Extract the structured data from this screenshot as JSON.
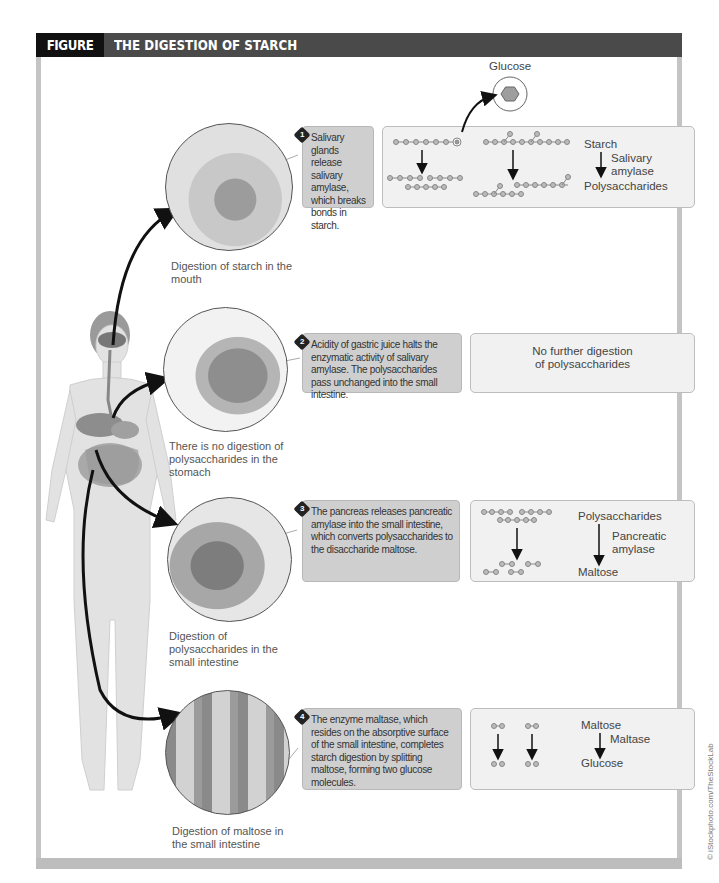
{
  "figure": {
    "number": "FIGURE 4.11",
    "title": "THE DIGESTION OF STARCH",
    "credit": "© iStockphoto.com/TheStockLab"
  },
  "glucose_label": "Glucose",
  "steps": [
    {
      "number": "1",
      "caption": "Salivary glands release salivary amylase, which breaks bonds in starch.",
      "location_label": "Digestion of starch in the mouth",
      "illustration": "mouth-cross-section",
      "result": {
        "top": "Starch",
        "enzyme": "Salivary amylase",
        "bottom": "Polysaccharides"
      }
    },
    {
      "number": "2",
      "caption": "Acidity of gastric juice halts the enzymatic activity of salivary amylase. The polysaccharides pass unchanged into the small intestine.",
      "location_label": "There is no digestion of polysaccharides in the stomach",
      "illustration": "stomach",
      "result": {
        "text": "No further digestion of polysaccharides"
      }
    },
    {
      "number": "3",
      "caption": "The pancreas releases pancreatic amylase into the small intestine, which converts polysaccharides to the disaccharide maltose.",
      "location_label": "Digestion of polysaccharides in the small intestine",
      "illustration": "pancreas-duodenum",
      "result": {
        "top": "Polysaccharides",
        "enzyme": "Pancreatic amylase",
        "bottom": "Maltose"
      }
    },
    {
      "number": "4",
      "caption": "The enzyme maltase, which resides on the absorptive surface of the small intestine, completes starch digestion by splitting maltose, forming two glucose molecules.",
      "location_label": "Digestion of maltose in the small intestine",
      "illustration": "intestinal-villi",
      "result": {
        "top": "Maltose",
        "enzyme": "Maltase",
        "bottom": "Glucose"
      }
    }
  ],
  "colors": {
    "header_bg": "#4a4a4a",
    "figure_number_bg": "#111111",
    "caption_bg": "#cfcfcf",
    "result_bg": "#f1f1f1",
    "frame": "#c4c4c4"
  }
}
